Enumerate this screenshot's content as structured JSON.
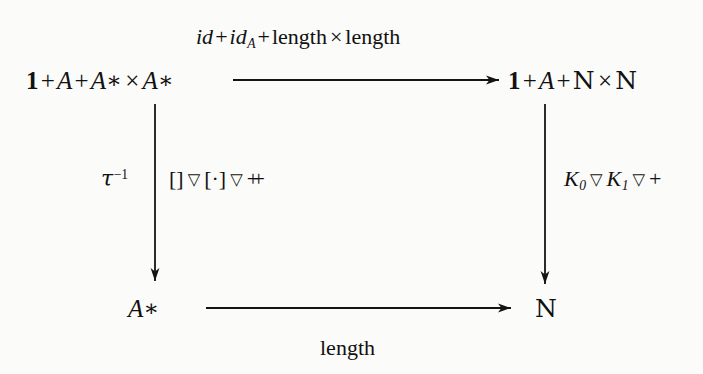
{
  "diagram": {
    "kind": "commutative-diagram",
    "nodes": {
      "top_left": {
        "text": "1 + A * × A *",
        "parts": [
          "1",
          "+",
          "A",
          "+",
          "A*",
          "×",
          "A*"
        ],
        "display": "1 + A + A∗ × A∗"
      },
      "top_right": {
        "display": "1 + A + ℕ × ℕ"
      },
      "bottom_left": {
        "display": "A∗"
      },
      "bottom_right": {
        "display": "ℕ"
      }
    },
    "arrows": {
      "top": {
        "label": "id + id_A + length × length",
        "direction": "right",
        "from": "top_left",
        "to": "top_right"
      },
      "bottom": {
        "label": "length",
        "direction": "right",
        "from": "bottom_left",
        "to": "bottom_right"
      },
      "left": {
        "label_outer": "τ⁻¹",
        "label_inner": "[] ▽ [·] ▽ ⧺",
        "direction": "down",
        "from": "top_left",
        "to": "bottom_left"
      },
      "right": {
        "label": "K₀ ▽ K₁ ▽ +",
        "direction": "down",
        "from": "top_right",
        "to": "bottom_right"
      }
    },
    "tokens": {
      "one": "1",
      "plus": "+",
      "A": "A",
      "star": "∗",
      "times": "×",
      "N": "N",
      "id": "id",
      "sub_A": "A",
      "length": "length",
      "tau": "τ",
      "sup_minus1": "−1",
      "bracket_open": "[",
      "bracket_close": "]",
      "dot": "·",
      "nabla": "▽",
      "concat": "++",
      "K": "K",
      "sub_0": "0",
      "sub_1": "1"
    },
    "colors": {
      "background": "#fbfbfa",
      "ink": "#111111"
    }
  }
}
